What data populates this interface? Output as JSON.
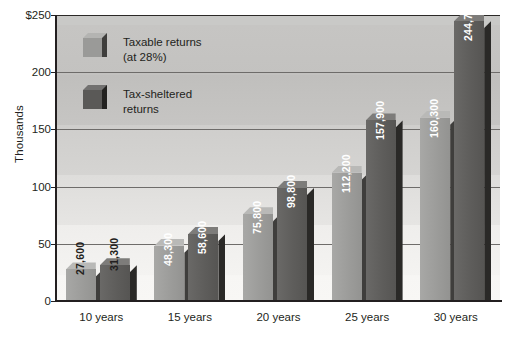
{
  "chart_data": {
    "type": "bar",
    "title": "",
    "xlabel": "",
    "ylabel": "Thousands",
    "ylim": [
      0,
      250
    ],
    "ytick_values": [
      0,
      50,
      100,
      150,
      200,
      250
    ],
    "ytick_labels": [
      "0",
      "50",
      "100",
      "150",
      "200",
      "$250"
    ],
    "grid": true,
    "legend_position": "inside-top-left",
    "categories": [
      "10 years",
      "15 years",
      "20 years",
      "25 years",
      "30 years"
    ],
    "series": [
      {
        "name": "Taxable returns (at 28%)",
        "color": "#9a9a98",
        "values": [
          27600,
          31300,
          75800,
          112200,
          160300
        ],
        "value_labels": [
          "27,600",
          "",
          "75,800",
          "112,200",
          "160,300"
        ]
      },
      {
        "name": "Tax-sheltered returns",
        "color": "#5a5957",
        "values": [
          31300,
          58600,
          98800,
          157900,
          244700
        ],
        "value_labels": [
          "31,300",
          "58,600",
          "98,800",
          "157,900",
          "244,700"
        ]
      }
    ],
    "bars": [
      {
        "group": "10 years",
        "series": "Taxable returns (at 28%)",
        "value": 27600,
        "label": "27,600",
        "label_inside": false
      },
      {
        "group": "10 years",
        "series": "Tax-sheltered returns",
        "value": 31300,
        "label": "31,300",
        "label_inside": false
      },
      {
        "group": "15 years",
        "series": "Taxable returns (at 28%)",
        "value": 48300,
        "label": "48,300",
        "label_inside": true
      },
      {
        "group": "15 years",
        "series": "Tax-sheltered returns",
        "value": 58600,
        "label": "58,600",
        "label_inside": true
      },
      {
        "group": "20 years",
        "series": "Taxable returns (at 28%)",
        "value": 75800,
        "label": "75,800",
        "label_inside": true
      },
      {
        "group": "20 years",
        "series": "Tax-sheltered returns",
        "value": 98800,
        "label": "98,800",
        "label_inside": true
      },
      {
        "group": "25 years",
        "series": "Taxable returns (at 28%)",
        "value": 112200,
        "label": "112,200",
        "label_inside": true
      },
      {
        "group": "25 years",
        "series": "Tax-sheltered returns",
        "value": 157900,
        "label": "157,900",
        "label_inside": true
      },
      {
        "group": "30 years",
        "series": "Taxable returns (at 28%)",
        "value": 160300,
        "label": "160,300",
        "label_inside": true
      },
      {
        "group": "30 years",
        "series": "Tax-sheltered returns",
        "value": 244700,
        "label": "244,700",
        "label_inside": true
      }
    ]
  },
  "legend": {
    "items": [
      {
        "label_line1": "Taxable returns",
        "label_line2": "(at 28%)",
        "swatch": "light"
      },
      {
        "label_line1": "Tax-sheltered",
        "label_line2": "returns",
        "swatch": "dark"
      }
    ]
  },
  "axis": {
    "y_title": "Thousands",
    "y_ticks": [
      "$250",
      "200",
      "150",
      "100",
      "50",
      "0"
    ],
    "x_ticks": [
      "10 years",
      "15 years",
      "20 years",
      "25 years",
      "30 years"
    ]
  }
}
